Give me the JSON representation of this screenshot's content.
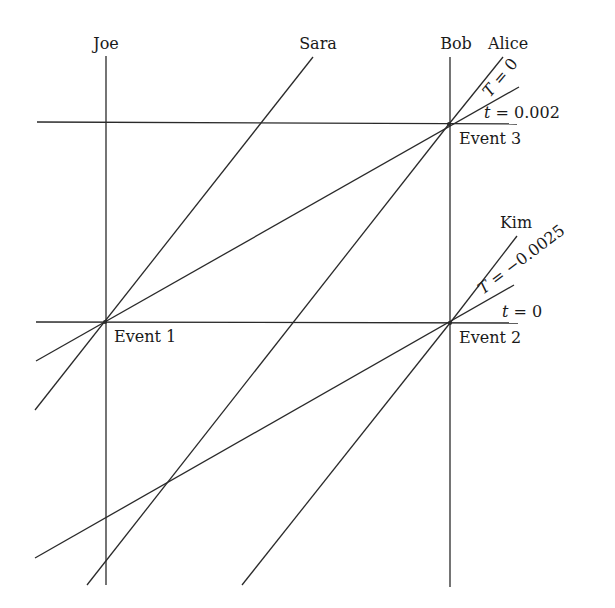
{
  "diagram": {
    "type": "spacetime-diagram",
    "colors": {
      "line": "#2a2a2a",
      "text": "#1a1a1a",
      "background": "#ffffff"
    },
    "observers": [
      {
        "id": "joe",
        "label": "Joe",
        "x1": 106,
        "y1": 56,
        "x2": 106,
        "y2": 585,
        "lx": 106,
        "ly": 49
      },
      {
        "id": "sara",
        "label": "Sara",
        "x1": 313,
        "y1": 57,
        "x2": 35,
        "y2": 410,
        "lx": 318,
        "ly": 49
      },
      {
        "id": "bob",
        "label": "Bob",
        "x1": 450,
        "y1": 57,
        "x2": 450,
        "y2": 587,
        "lx": 456,
        "ly": 49
      },
      {
        "id": "alice",
        "label": "Alice",
        "x1": 503,
        "y1": 57,
        "x2": 449,
        "y2": 124,
        "lx": 508,
        "ly": 49
      },
      {
        "id": "kim",
        "label": "Kim",
        "x1": 517,
        "y1": 236,
        "x2": 450,
        "y2": 323,
        "lx": 516,
        "ly": 228
      }
    ],
    "lines": [
      {
        "id": "t-0.002-line",
        "x1": 37,
        "y1": 122,
        "x2": 517,
        "y2": 124
      },
      {
        "id": "t-0-line",
        "x1": 36,
        "y1": 322,
        "x2": 518,
        "y2": 323
      },
      {
        "id": "T-0-line",
        "x1": 519,
        "y1": 87,
        "x2": 36,
        "y2": 361
      },
      {
        "id": "alice-past-line",
        "x1": 449,
        "y1": 124,
        "x2": 87,
        "y2": 585
      },
      {
        "id": "T-neg0.0025-line",
        "x1": 514,
        "y1": 285,
        "x2": 35,
        "y2": 558
      },
      {
        "id": "kim-past-line",
        "x1": 450,
        "y1": 323,
        "x2": 242,
        "y2": 585
      }
    ],
    "events": [
      {
        "id": "event-1",
        "label": "Event 1",
        "x": 105,
        "y": 322,
        "lx": 114,
        "ly": 342
      },
      {
        "id": "event-2",
        "label": "Event 2",
        "x": 450,
        "y": 323,
        "lx": 459,
        "ly": 343
      },
      {
        "id": "event-3",
        "label": "Event 3",
        "x": 449,
        "y": 124,
        "lx": 459,
        "ly": 144
      }
    ],
    "annotations": {
      "t_0002": {
        "var": "t",
        "rest": " = 0.002",
        "x": 484,
        "y": 118
      },
      "T_0": {
        "var": "T",
        "rest": " = 0",
        "x": 490,
        "y": 98,
        "angle": -50
      },
      "t_0": {
        "var": "t",
        "rest": " = 0",
        "x": 502,
        "y": 317
      },
      "T_neg": {
        "var": "T",
        "rest": " = −0.0025",
        "x": 483,
        "y": 295,
        "angle": -37
      }
    }
  }
}
